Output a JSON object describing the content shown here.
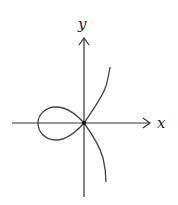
{
  "diagram": {
    "type": "curve-plot",
    "axes": {
      "x_label": "x",
      "y_label": "y"
    },
    "colors": {
      "axis": "#333333",
      "curve": "#444444",
      "background": "#ffffff"
    }
  }
}
